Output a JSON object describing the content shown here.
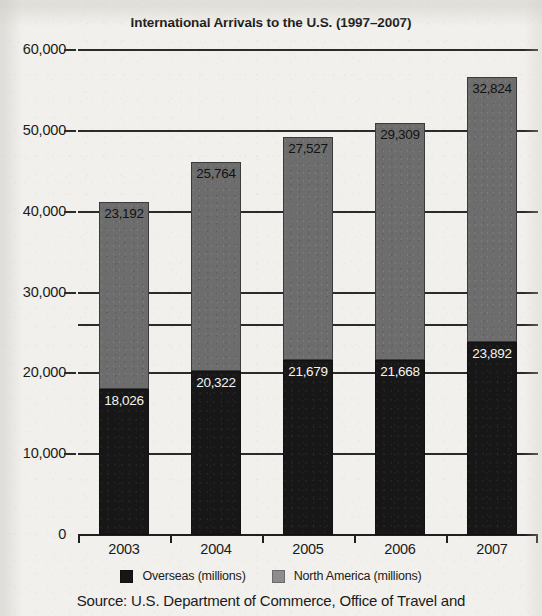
{
  "chart_data": {
    "type": "bar",
    "subtype": "stacked-bar",
    "title": "International Arrivals to the U.S. (1997–2007)",
    "xlabel": "",
    "ylabel": "",
    "categories": [
      "2003",
      "2004",
      "2005",
      "2006",
      "2007"
    ],
    "series": [
      {
        "name": "Overseas (millions)",
        "color": "#171717",
        "values": [
          18026,
          20322,
          21679,
          21668,
          23892
        ],
        "labels": [
          "18,026",
          "20,322",
          "21,679",
          "21,668",
          "23,892"
        ]
      },
      {
        "name": "North America (millions)",
        "color": "#6d6d6d",
        "values": [
          23192,
          25764,
          27527,
          29309,
          32824
        ],
        "labels": [
          "23,192",
          "25,764",
          "27,527",
          "29,309",
          "32,824"
        ]
      }
    ],
    "totals": [
      41218,
      46086,
      49206,
      50977,
      56716
    ],
    "ylim": [
      0,
      60000
    ],
    "ytick_values": [
      0,
      10000,
      20000,
      30000,
      40000,
      50000,
      60000
    ],
    "ytick_labels": [
      "0",
      "10,000",
      "20,000",
      "30,000",
      "40,000",
      "50,000",
      "60,000"
    ],
    "extra_gridline_value": 26000,
    "grid": true,
    "legend_position": "bottom",
    "source": "Source: U.S. Department of Commerce, Office of Travel and"
  },
  "legend": {
    "items": [
      {
        "label": "Overseas (millions)",
        "swatch": "dark"
      },
      {
        "label": "North America (millions)",
        "swatch": "gray"
      }
    ]
  },
  "colors": {
    "background": "#f1f0ec",
    "overseas": "#171717",
    "north_america": "#6d6d6d",
    "axis": "#202020",
    "text": "#1b1b1b"
  }
}
